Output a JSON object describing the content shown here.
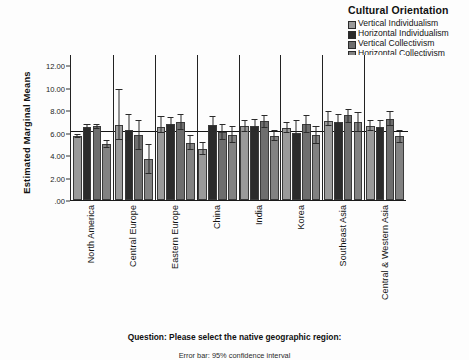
{
  "legend": {
    "title": "Cultural Orientation",
    "items": [
      {
        "label": "Vertical Individualism",
        "color": "#9a9a9a"
      },
      {
        "label": "Horizontal Individualism",
        "color": "#2b2b2b"
      },
      {
        "label": "Vertical Collectivism",
        "color": "#6e6e6e"
      },
      {
        "label": "Horizontal Collectivism",
        "color": "#828282"
      }
    ]
  },
  "axis": {
    "y_title": "Estimated Marginal Means",
    "y_ticks": [
      "12.00",
      "10.00",
      "8.00",
      "6.00",
      "4.00",
      "2.00",
      ".00"
    ]
  },
  "captions": {
    "question": "Question: Please select the native geographic region:",
    "error_note": "Error bar: 95% confidence interval"
  },
  "chart_data": {
    "type": "bar",
    "title": "",
    "subtitle": "",
    "xlabel": "Question: Please select the native geographic region:",
    "ylabel": "Estimated Marginal Means",
    "ylim": [
      0,
      13
    ],
    "yticks": [
      0,
      2,
      4,
      6,
      8,
      10,
      12
    ],
    "ytick_labels": [
      ".00",
      "2.00",
      "4.00",
      "6.00",
      "8.00",
      "10.00",
      "12.00"
    ],
    "grid": false,
    "legend_position": "top-right",
    "legend_title": "Cultural Orientation",
    "reference_line": 6.1,
    "error_bar_note": "Error bar: 95% confidence interval",
    "categories": [
      "North America",
      "Central Europe",
      "Eastern Europe",
      "China",
      "India",
      "Korea",
      "Southeast Asia",
      "Central & Western Asia"
    ],
    "series": [
      {
        "name": "Vertical Individualism",
        "color": "#9a9a9a",
        "values": [
          5.75,
          6.75,
          6.55,
          4.55,
          6.6,
          6.5,
          7.1,
          6.6
        ],
        "err_low": [
          5.55,
          5.35,
          6.05,
          4.05,
          6.1,
          6.0,
          6.6,
          6.15
        ],
        "err_high": [
          5.95,
          9.95,
          7.55,
          5.2,
          7.2,
          7.0,
          7.95,
          7.2
        ]
      },
      {
        "name": "Horizontal Individualism",
        "color": "#2b2b2b",
        "values": [
          6.55,
          6.25,
          6.8,
          6.75,
          6.65,
          6.0,
          6.95,
          6.55
        ],
        "err_low": [
          6.3,
          5.25,
          6.15,
          6.1,
          6.1,
          5.05,
          6.25,
          6.0
        ],
        "err_high": [
          6.8,
          7.7,
          7.45,
          7.55,
          7.3,
          7.2,
          7.75,
          7.15
        ]
      },
      {
        "name": "Vertical Collectivism",
        "color": "#6e6e6e",
        "values": [
          6.6,
          5.8,
          6.95,
          6.1,
          7.05,
          6.8,
          7.6,
          7.3
        ],
        "err_low": [
          6.4,
          4.45,
          6.25,
          5.35,
          6.5,
          6.0,
          6.9,
          6.65
        ],
        "err_high": [
          6.85,
          7.2,
          7.7,
          6.85,
          7.6,
          7.65,
          8.2,
          8.0
        ]
      },
      {
        "name": "Horizontal Collectivism",
        "color": "#828282",
        "values": [
          5.0,
          3.65,
          5.15,
          5.85,
          5.75,
          5.85,
          7.0,
          5.7
        ],
        "err_low": [
          4.7,
          2.35,
          4.5,
          5.1,
          5.25,
          5.05,
          6.1,
          5.1
        ],
        "err_high": [
          5.35,
          5.05,
          5.85,
          6.65,
          6.25,
          6.6,
          7.85,
          6.3
        ]
      }
    ]
  }
}
